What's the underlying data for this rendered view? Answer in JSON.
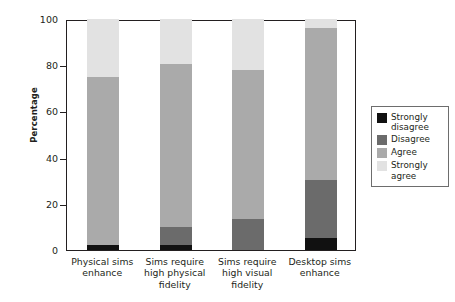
{
  "chart_data": {
    "type": "bar",
    "subtype": "stacked-bar",
    "title": "",
    "xlabel": "",
    "ylabel": "Percentage",
    "ylim": [
      0,
      100
    ],
    "yticks": [
      0,
      20,
      40,
      60,
      80,
      100
    ],
    "ytick_labels": [
      "0",
      "20",
      "40",
      "60",
      "80",
      "100"
    ],
    "grid": false,
    "legend_position": "right",
    "categories": [
      "Physical sims enhance",
      "Sims require high physical fidelity",
      "Sims require high visual fidelity",
      "Desktop sims enhance"
    ],
    "series": [
      {
        "name": "Strongly disagree",
        "color": "#111111",
        "values": [
          2,
          2,
          0,
          5
        ]
      },
      {
        "name": "Disagree",
        "color": "#6b6b6b",
        "values": [
          0,
          8,
          13.5,
          25.5
        ]
      },
      {
        "name": "Agree",
        "color": "#aaaaaa",
        "values": [
          73,
          70.5,
          64.5,
          65.5
        ]
      },
      {
        "name": "Strongly agree",
        "color": "#e2e2e2",
        "values": [
          25,
          19.5,
          22,
          4
        ]
      }
    ],
    "cumulative_tops": [
      [
        2,
        2,
        75,
        100
      ],
      [
        2,
        10,
        80.5,
        100
      ],
      [
        0,
        13.5,
        78,
        100
      ],
      [
        5,
        30.5,
        96,
        100
      ]
    ]
  },
  "axis": {
    "ylabel": "Percentage",
    "ticks": [
      {
        "value": 100,
        "label": "100"
      },
      {
        "value": 80,
        "label": "80"
      },
      {
        "value": 60,
        "label": "60"
      },
      {
        "value": 40,
        "label": "40"
      },
      {
        "value": 20,
        "label": "20"
      },
      {
        "value": 0,
        "label": "0"
      }
    ]
  },
  "xlabels": [
    {
      "line1": "Physical sims",
      "line2": "enhance",
      "line3": ""
    },
    {
      "line1": "Sims require",
      "line2": "high physical",
      "line3": "fidelity"
    },
    {
      "line1": "Sims require",
      "line2": "high visual",
      "line3": "fidelity"
    },
    {
      "line1": "Desktop sims",
      "line2": "enhance",
      "line3": ""
    }
  ],
  "legend": {
    "items": [
      {
        "label1": "Strongly",
        "label2": "disagree",
        "color": "#111111"
      },
      {
        "label1": "Disagree",
        "label2": "",
        "color": "#6b6b6b"
      },
      {
        "label1": "Agree",
        "label2": "",
        "color": "#aaaaaa"
      },
      {
        "label1": "Strongly",
        "label2": "agree",
        "color": "#e2e2e2"
      }
    ]
  }
}
